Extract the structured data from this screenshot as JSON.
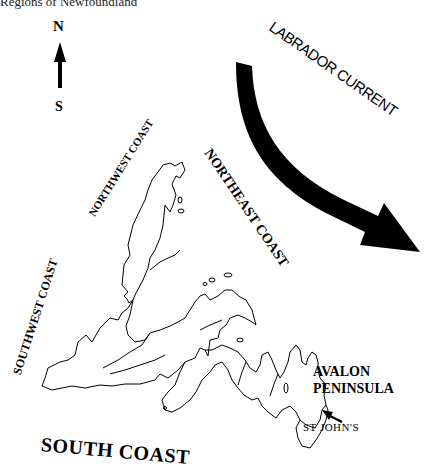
{
  "caption": "Regions of Newfoundland",
  "compass": {
    "north": "N",
    "south": "S"
  },
  "labels": {
    "labrador_current": "LABRADOR CURRENT",
    "northwest_coast": "NORTHWEST COAST",
    "northeast_coast": "NORTHEAST COAST",
    "southwest_coast": "SOUTHWEST COAST",
    "south_coast": "SOUTH COAST",
    "avalon_line1": "AVALON",
    "avalon_line2": "PENINSULA",
    "st_johns": "ST JOHN'S"
  },
  "colors": {
    "ink": "#000000",
    "background": "#ffffff"
  }
}
